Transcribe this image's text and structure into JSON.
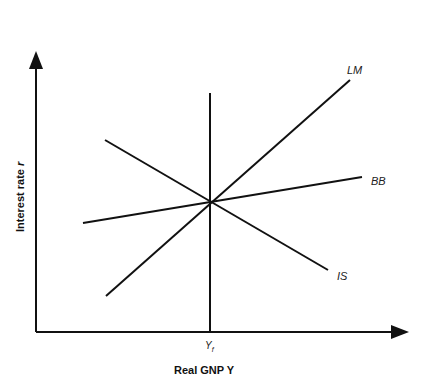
{
  "diagram": {
    "x_axis": {
      "label_main": "Real GNP ",
      "label_var": "Y"
    },
    "y_axis": {
      "label_main": "Interest rate ",
      "label_var": "r"
    },
    "vertical_line": {
      "label_main": "Y",
      "label_sub": "f"
    },
    "curves": [
      {
        "name": "LM",
        "label": "LM",
        "from": [
          106,
          296
        ],
        "to": [
          350,
          80
        ],
        "label_pos": [
          347,
          74
        ]
      },
      {
        "name": "BB",
        "label": "BB",
        "from": [
          83,
          223
        ],
        "to": [
          362,
          177
        ],
        "label_pos": [
          371,
          184
        ]
      },
      {
        "name": "IS",
        "label": "IS",
        "from": [
          105,
          140
        ],
        "to": [
          328,
          270
        ],
        "label_pos": [
          337,
          279
        ]
      }
    ],
    "equilibrium_point": [
      211,
      203
    ],
    "colors": {
      "line": "#111111",
      "background": "#ffffff"
    }
  }
}
